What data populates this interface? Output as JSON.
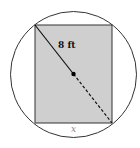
{
  "diagram": {
    "radius_label": "8 ft",
    "side_label": "x",
    "colors": {
      "rect_fill": "#cfcfcf",
      "stroke": "#222222",
      "side_label": "#888888"
    }
  }
}
